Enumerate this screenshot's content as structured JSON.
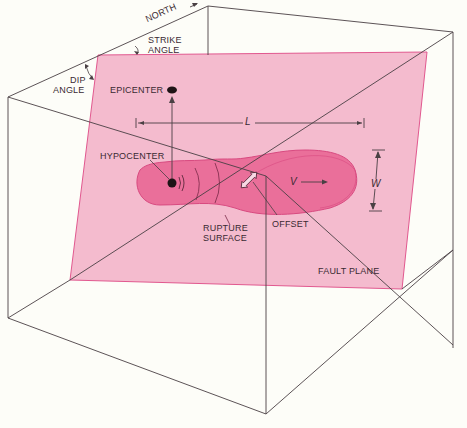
{
  "diagram": {
    "colors": {
      "background": "#fdfdf8",
      "fault_plane": "#f4b8cc",
      "fault_plane_edge": "#e0508a",
      "rupture_surface": "#ea6f9a",
      "rupture_edge": "#d84a80",
      "lines": "#4a4044",
      "text": "#3a2a32"
    },
    "labels": {
      "north": "NORTH",
      "strike_angle_1": "STRIKE",
      "strike_angle_2": "ANGLE",
      "dip_angle_1": "DIP",
      "dip_angle_2": "ANGLE",
      "epicenter": "EPICENTER",
      "hypocenter": "HYPOCENTER",
      "length": "L",
      "width": "W",
      "velocity": "V",
      "rupture_surface_1": "RUPTURE",
      "rupture_surface_2": "SURFACE",
      "offset": "OFFSET",
      "fault_plane": "FAULT PLANE"
    },
    "nodes": [
      {
        "id": "epicenter",
        "label": "EPICENTER"
      },
      {
        "id": "hypocenter",
        "label": "HYPOCENTER"
      },
      {
        "id": "rupture-surface",
        "label": "RUPTURE SURFACE"
      },
      {
        "id": "offset",
        "label": "OFFSET"
      },
      {
        "id": "fault-plane",
        "label": "FAULT PLANE"
      }
    ],
    "edges": [
      {
        "from": "hypocenter",
        "to": "epicenter",
        "type": "arrow"
      }
    ]
  }
}
